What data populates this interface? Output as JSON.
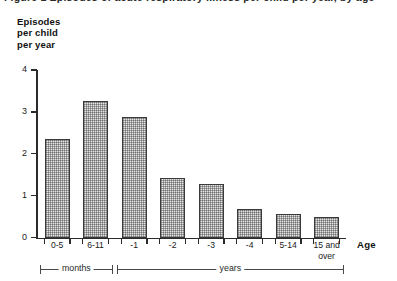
{
  "figure": {
    "clipped_caption": "Figure 1  Episodes of acute respiratory illness per child per year, by age",
    "y_axis_title": "Episodes\nper child\nper year",
    "x_axis_title": "Age"
  },
  "chart_data": {
    "type": "bar",
    "title": "Episodes per child per year",
    "xlabel": "Age",
    "ylabel": "Episodes per child per year",
    "ylim": [
      0,
      4
    ],
    "yticks": [
      "0",
      "1",
      "2",
      "3",
      "4"
    ],
    "ytick_values": [
      0,
      1,
      2,
      3,
      4
    ],
    "grid": false,
    "legend": "none",
    "categories": [
      "0-5",
      "6-11",
      "-1",
      "-2",
      "-3",
      "-4",
      "5-14",
      "15 and\nover"
    ],
    "category_labels_flat": [
      "0-5",
      "6-11",
      "-1",
      "-2",
      "-3",
      "-4",
      "5-14",
      "15 and over"
    ],
    "values": [
      2.36,
      3.26,
      2.88,
      1.43,
      1.29,
      0.69,
      0.57,
      0.48
    ],
    "groups": [
      {
        "label": "months",
        "categories": [
          "0-5",
          "6-11"
        ]
      },
      {
        "label": "years",
        "categories": [
          "-1",
          "-2",
          "-3",
          "-4",
          "5-14",
          "15 and over"
        ]
      }
    ],
    "bar_fill_color": "#e4e4e4",
    "bar_border_color": "#3a3a3a",
    "bar_fill_pattern": "fine-checkerboard-stipple"
  }
}
